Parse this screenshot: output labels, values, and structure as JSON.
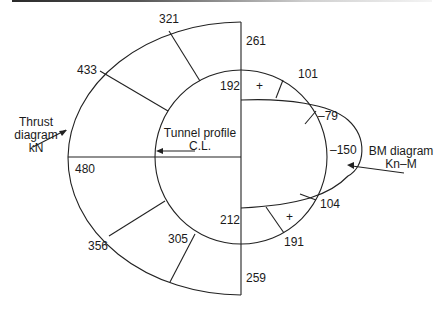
{
  "diagram": {
    "title_bar": "",
    "thrust_diagram": {
      "label_line1": "Thrust",
      "label_line2": "diagram",
      "label_line3": "kN",
      "values": {
        "top": "261",
        "upper_1": "321",
        "upper_2": "433",
        "springline": "480",
        "lower_1": "356",
        "lower_2": "305",
        "bottom": "259"
      }
    },
    "tunnel_profile": {
      "label_line1": "Tunnel profile",
      "label_line2": "C.L."
    },
    "bm_diagram": {
      "label_line1": "BM diagram",
      "label_line2": "Kn–M",
      "values": {
        "crown": "192",
        "upper_pos": "101",
        "upper_neg": "–79",
        "springline": "–150",
        "lower_neg": "104",
        "lower_pos": "191",
        "invert": "212"
      },
      "sign_upper": "+",
      "sign_lower": "+"
    }
  }
}
